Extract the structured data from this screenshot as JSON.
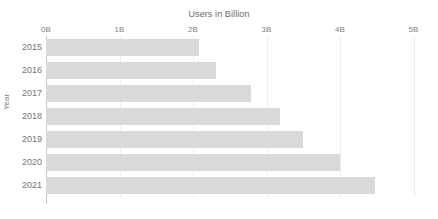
{
  "chart_data": {
    "type": "bar",
    "orientation": "horizontal",
    "title": "Users in Billion",
    "xlabel": "Users in Billion",
    "ylabel": "Year",
    "categories": [
      "2015",
      "2016",
      "2017",
      "2018",
      "2019",
      "2020",
      "2021"
    ],
    "values": [
      2.08,
      2.31,
      2.79,
      3.19,
      3.49,
      4.0,
      4.48
    ],
    "xlim": [
      0,
      5
    ],
    "ylim": null,
    "xticks": [
      0,
      1,
      2,
      3,
      4,
      5
    ],
    "xtick_labels": [
      "0B",
      "1B",
      "2B",
      "3B",
      "4B",
      "5B"
    ],
    "grid": true,
    "grid_axis": "x",
    "legend": false,
    "legend_position": "none",
    "bar_color": "#d9d9d9",
    "gridline_color": "#ececec",
    "axis_color": "#c4c4c4",
    "tick_label_color": "#7d8184",
    "background_color": "#ffffff",
    "series": [
      {
        "name": "Users in Billion",
        "values": [
          2.08,
          2.31,
          2.79,
          3.19,
          3.49,
          4.0,
          4.48
        ]
      }
    ]
  }
}
